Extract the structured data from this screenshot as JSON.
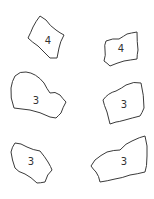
{
  "colors": {
    "background": "#ffffff",
    "stroke": "#3a3a3a",
    "text": "#333333"
  },
  "pieces": [
    {
      "id": "piece-1",
      "label": "4",
      "position": "top-left"
    },
    {
      "id": "piece-2",
      "label": "4",
      "position": "top-right"
    },
    {
      "id": "piece-3",
      "label": "3",
      "position": "middle-left"
    },
    {
      "id": "piece-4",
      "label": "3",
      "position": "middle-right"
    },
    {
      "id": "piece-5",
      "label": "3",
      "position": "bottom-left"
    },
    {
      "id": "piece-6",
      "label": "3",
      "position": "bottom-right"
    }
  ]
}
